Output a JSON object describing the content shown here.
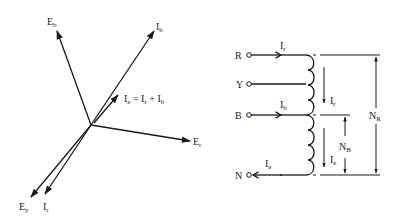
{
  "phasor_diagram": {
    "origin": {
      "x": 91,
      "y": 125
    },
    "vectors": [
      {
        "id": "Eb",
        "main": "E",
        "sub": "b",
        "tip": {
          "x": 57,
          "y": 31
        }
      },
      {
        "id": "Ib",
        "main": "I",
        "sub": "b",
        "tip": {
          "x": 154,
          "y": 31
        }
      },
      {
        "id": "Ie",
        "main": "I",
        "sub": "e",
        "tip": {
          "x": 118,
          "y": 95
        }
      },
      {
        "id": "Er",
        "main": "E",
        "sub": "r",
        "tip": {
          "x": 190,
          "y": 141
        }
      },
      {
        "id": "Ey",
        "main": "E",
        "sub": "y",
        "tip": {
          "x": 31,
          "y": 197
        }
      },
      {
        "id": "Ir",
        "main": "I",
        "sub": "r",
        "tip": {
          "x": 45,
          "y": 194
        }
      }
    ],
    "labels": {
      "Eb": {
        "main": "E",
        "sub": "b"
      },
      "Ib": {
        "main": "I",
        "sub": "b"
      },
      "Er": {
        "main": "E",
        "sub": "r"
      },
      "Ey": {
        "main": "E",
        "sub": "y"
      },
      "Ir": {
        "main": "I",
        "sub": "r"
      },
      "equation": {
        "t1": "I",
        "s1": "e",
        "t2": " = I",
        "s2": "r",
        "t3": " + I",
        "s3": "b"
      }
    }
  },
  "winding_diagram": {
    "terminals": [
      {
        "id": "R",
        "label": "R"
      },
      {
        "id": "Y",
        "label": "Y"
      },
      {
        "id": "B",
        "label": "B"
      },
      {
        "id": "N",
        "label": "N"
      }
    ],
    "currents": {
      "Ir_in": {
        "main": "I",
        "sub": "r"
      },
      "Ib_in": {
        "main": "I",
        "sub": "b"
      },
      "Ie_out": {
        "main": "I",
        "sub": "e"
      },
      "Ir_down": {
        "main": "I",
        "sub": "r"
      },
      "Ie_down": {
        "main": "I",
        "sub": "e"
      }
    },
    "dimensions": {
      "NR": {
        "main": "N",
        "sub": "R"
      },
      "NB": {
        "main": "N",
        "sub": "B"
      }
    }
  }
}
